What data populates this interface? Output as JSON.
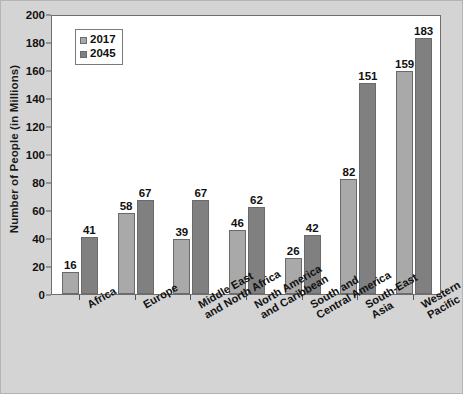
{
  "chart_data": {
    "type": "bar",
    "title": "",
    "xlabel": "",
    "ylabel": "Number of People (in Millions)",
    "ylim": [
      0,
      200
    ],
    "ytick_step": 20,
    "yticks": [
      0,
      20,
      40,
      60,
      80,
      100,
      120,
      140,
      160,
      180,
      200
    ],
    "grid": false,
    "legend_position": "top-left",
    "categories": [
      "Africa",
      "Europe",
      "Middle East and North Africa",
      "North America and Caribbean",
      "South and Central America",
      "South-East Asia",
      "Western Pacific"
    ],
    "category_lines": [
      [
        "Africa"
      ],
      [
        "Europe"
      ],
      [
        "Middle East",
        "and North Africa"
      ],
      [
        "North America",
        "and Caribbean"
      ],
      [
        "South and",
        "Central America"
      ],
      [
        "South-East",
        "Asia"
      ],
      [
        "Western",
        "Pacific"
      ]
    ],
    "series": [
      {
        "name": "2017",
        "color": "#a9a9a9",
        "values": [
          16,
          58,
          39,
          46,
          26,
          82,
          159
        ]
      },
      {
        "name": "2045",
        "color": "#808080",
        "values": [
          41,
          67,
          67,
          62,
          42,
          151,
          183
        ]
      }
    ]
  },
  "legend": {
    "items": [
      {
        "label": "2017",
        "color": "#a9a9a9"
      },
      {
        "label": "2045",
        "color": "#808080"
      }
    ]
  },
  "axes": {
    "y_title": "Number of People (in Millions)"
  },
  "colors": {
    "series_2017": "#a9a9a9",
    "series_2045": "#808080",
    "plot_background": "#ffffff",
    "figure_background": "#d4d4d4",
    "axis_line": "#6e6e6e",
    "text": "#111111"
  }
}
